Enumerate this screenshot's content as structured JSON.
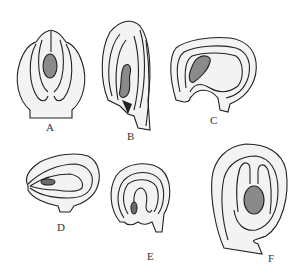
{
  "figure": {
    "panels": [
      {
        "id": "A",
        "label": "A"
      },
      {
        "id": "B",
        "label": "B"
      },
      {
        "id": "C",
        "label": "C"
      },
      {
        "id": "D",
        "label": "D"
      },
      {
        "id": "E",
        "label": "E"
      },
      {
        "id": "F",
        "label": "F"
      }
    ],
    "colors": {
      "outline": "#222222",
      "fill": "#f1f1f1",
      "embryo_sac": "#8a8a8a"
    }
  }
}
